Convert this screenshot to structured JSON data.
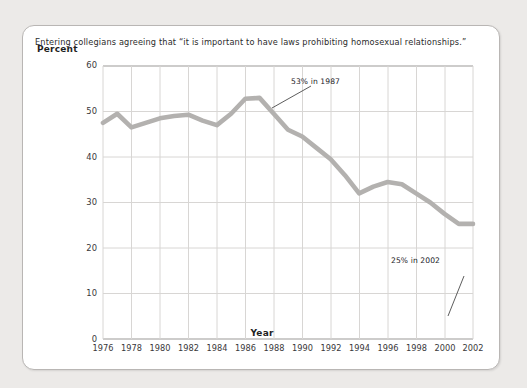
{
  "chart_data": {
    "type": "line",
    "title": "Entering collegians agreeing that “it is important to have laws prohibiting homosexual relationships.”",
    "xlabel": "Year",
    "ylabel": "Percent",
    "xlim": [
      1976,
      2002
    ],
    "ylim": [
      0,
      60
    ],
    "yticks": [
      0,
      10,
      20,
      30,
      40,
      50,
      60
    ],
    "xticks": [
      1976,
      1978,
      1980,
      1982,
      1984,
      1986,
      1988,
      1990,
      1992,
      1994,
      1996,
      1998,
      2000,
      2002
    ],
    "grid": true,
    "legend": "none",
    "line_color": "#b3b1af",
    "x": [
      1976,
      1977,
      1978,
      1979,
      1980,
      1981,
      1982,
      1983,
      1984,
      1985,
      1986,
      1987,
      1988,
      1989,
      1990,
      1991,
      1992,
      1993,
      1994,
      1995,
      1996,
      1997,
      1998,
      1999,
      2000,
      2001,
      2002
    ],
    "values": [
      47.5,
      49.5,
      46.5,
      47.5,
      48.5,
      49.0,
      49.3,
      48.0,
      47.0,
      49.5,
      52.8,
      53.0,
      49.5,
      46.0,
      44.5,
      42.0,
      39.5,
      36.0,
      32.0,
      33.5,
      34.5,
      34.0,
      32.0,
      30.0,
      27.5,
      25.3,
      25.3
    ],
    "annotations": [
      {
        "text": "53% in 1987",
        "x": 1987,
        "y": 53
      },
      {
        "text": "25% in 2002",
        "x": 2002,
        "y": 25
      }
    ]
  },
  "axis": {
    "ylabel": "Percent",
    "xlabel": "Year",
    "yticks": [
      "60",
      "50",
      "40",
      "30",
      "20",
      "10",
      "0"
    ],
    "xticks": [
      "1976",
      "1978",
      "1980",
      "1982",
      "1984",
      "1986",
      "1988",
      "1990",
      "1992",
      "1994",
      "1996",
      "1998",
      "2000",
      "2002"
    ]
  },
  "annotations": {
    "peak": "53% in 1987",
    "end": "25% in 2002"
  },
  "colors": {
    "line": "#b3b1af",
    "grid": "#d8d6d4",
    "axis": "#8e8c8a",
    "card_border": "#b9b6b4",
    "page_background": "#eceae8"
  }
}
